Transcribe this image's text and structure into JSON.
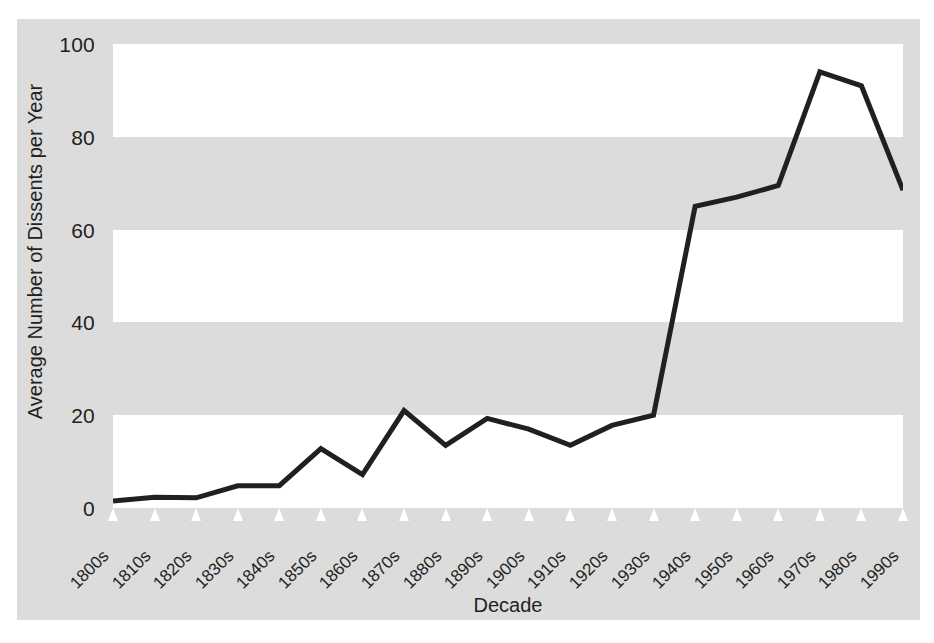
{
  "chart_data": {
    "type": "line",
    "title": "",
    "xlabel": "Decade",
    "ylabel": "Average Number of Dissents per Year",
    "categories": [
      "1800s",
      "1810s",
      "1820s",
      "1830s",
      "1840s",
      "1850s",
      "1860s",
      "1870s",
      "1880s",
      "1890s",
      "1900s",
      "1910s",
      "1920s",
      "1930s",
      "1940s",
      "1950s",
      "1960s",
      "1970s",
      "1980s",
      "1990s"
    ],
    "values": [
      1.5,
      2.3,
      2.2,
      4.8,
      4.8,
      12.8,
      7.2,
      21.0,
      13.5,
      19.3,
      17.0,
      13.5,
      17.8,
      20.0,
      65.0,
      67.0,
      69.5,
      94.0,
      91.0,
      68.5
    ],
    "series": [
      {
        "name": "Average Number of Dissents per Year",
        "values": [
          1.5,
          2.3,
          2.2,
          4.8,
          4.8,
          12.8,
          7.2,
          21.0,
          13.5,
          19.3,
          17.0,
          13.5,
          17.8,
          20.0,
          65.0,
          67.0,
          69.5,
          94.0,
          91.0,
          68.5
        ]
      }
    ],
    "ylim": [
      0,
      100
    ],
    "yticks": [
      0,
      20,
      40,
      60,
      80,
      100
    ],
    "ytick_labels": [
      "0",
      "20",
      "40",
      "60",
      "80",
      "100"
    ],
    "grid": "alternating-horizontal-bands",
    "legend": "none",
    "line_color": "#231f20",
    "line_width": 5,
    "band_color_light": "#ffffff",
    "band_color_dark": "#dcdcdc",
    "frame_color": "#dcdcdc",
    "text_color": "#231f20",
    "tick_marker": "white-triangle-up"
  }
}
